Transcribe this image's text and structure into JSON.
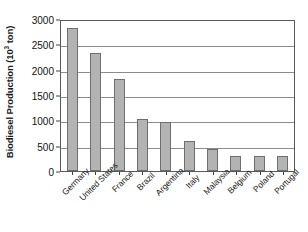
{
  "chart_data": {
    "type": "bar",
    "title": "",
    "xlabel": "",
    "ylabel": "Biodiesel Production (10³ ton)",
    "ylabel_base": "Biodiesel Production (10",
    "ylabel_exponent": "3",
    "ylabel_tail": " ton)",
    "categories": [
      "Germany",
      "United States",
      "France",
      "Brazil",
      "Argentina",
      "Italy",
      "Malaysia",
      "Belgium",
      "Poland",
      "Portugal"
    ],
    "values": [
      2820,
      2330,
      1820,
      1030,
      960,
      600,
      440,
      295,
      300,
      300
    ],
    "ylim": [
      0,
      3000
    ],
    "yticks": [
      3000,
      2500,
      2000,
      1500,
      1000,
      500,
      0
    ],
    "ytick_labels": [
      "3000",
      "2500",
      "2000",
      "1500",
      "1000",
      "500",
      "0"
    ],
    "grid": true,
    "grid_axis": "y",
    "legend": false,
    "bar_fill_color": "#b3b3b3",
    "bar_edge_color": "#6e6e6e",
    "grid_color": "#8c8c8c",
    "frame_color": "#595959",
    "background_color": "#ffffff"
  }
}
